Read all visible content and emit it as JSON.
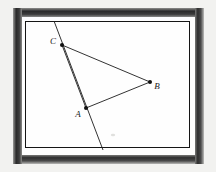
{
  "figure": {
    "frame": {
      "outer_background_color": "#f2f2f0",
      "frame_dark_color": "#262626",
      "mat_color": "#fbfbfa",
      "inner_border_color": "#151515",
      "canvas_color": "#fefefe"
    },
    "canvas": {
      "color": "#fefefe",
      "inner_rect": {
        "x": 25,
        "y": 21,
        "width": 165,
        "height": 127
      }
    },
    "points": [
      {
        "id": "C",
        "label": "C",
        "x": 62,
        "y": 45,
        "label_x": 53,
        "label_y": 44,
        "marker_radius": 2.0
      },
      {
        "id": "B",
        "label": "B",
        "x": 150,
        "y": 82,
        "label_x": 155,
        "label_y": 89,
        "marker_radius": 2.0
      },
      {
        "id": "A",
        "label": "A",
        "x": 86,
        "y": 108,
        "label_x": 76,
        "label_y": 116,
        "marker_radius": 2.0
      }
    ],
    "segments": [
      {
        "id": "CB",
        "from": "C",
        "to": "B",
        "x1": 62,
        "y1": 45,
        "x2": 150,
        "y2": 82,
        "stroke": "#1c1c1c",
        "width": 0.9
      },
      {
        "id": "AB",
        "from": "A",
        "to": "B",
        "x1": 86,
        "y1": 108,
        "x2": 150,
        "y2": 82,
        "stroke": "#1c1c1c",
        "width": 0.9
      },
      {
        "id": "CA",
        "from": "C",
        "to": "A",
        "x1": 62,
        "y1": 45,
        "x2": 86,
        "y2": 108,
        "stroke": "#1c1c1c",
        "width": 0.9
      }
    ],
    "transversal": {
      "id": "line-through-C-A",
      "x1": 54,
      "y1": 21,
      "x2": 103,
      "y2": 150,
      "stroke": "#1c1c1c",
      "width": 0.9
    },
    "line_color": "#1c1c1c",
    "label_color": "#1a1a1a"
  }
}
